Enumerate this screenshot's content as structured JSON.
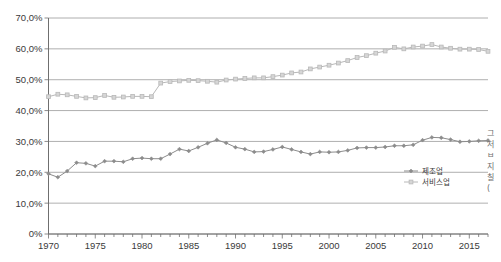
{
  "chart_data": {
    "type": "line",
    "title": "",
    "xlabel": "",
    "ylabel": "",
    "xlim": [
      1970,
      2017
    ],
    "ylim": [
      0,
      70
    ],
    "grid": true,
    "y_ticks": [
      0,
      10,
      20,
      30,
      40,
      50,
      60,
      70
    ],
    "y_tick_labels": [
      "0%",
      "10,0%",
      "20,0%",
      "30,0%",
      "40,0%",
      "50,0%",
      "60,0%",
      "70,0%"
    ],
    "x_ticks": [
      1970,
      1975,
      1980,
      1985,
      1990,
      1995,
      2000,
      2005,
      2010,
      2015
    ],
    "x_tick_labels": [
      "1970",
      "1975",
      "1980",
      "1985",
      "1990",
      "1995",
      "2000",
      "2005",
      "2010",
      "2015"
    ],
    "x_minor_tick_interval": 1,
    "legend_position": "inside-bottom-right",
    "x": [
      1970,
      1971,
      1972,
      1973,
      1974,
      1975,
      1976,
      1977,
      1978,
      1979,
      1980,
      1981,
      1982,
      1983,
      1984,
      1985,
      1986,
      1987,
      1988,
      1989,
      1990,
      1991,
      1992,
      1993,
      1994,
      1995,
      1996,
      1997,
      1998,
      1999,
      2000,
      2001,
      2002,
      2003,
      2004,
      2005,
      2006,
      2007,
      2008,
      2009,
      2010,
      2011,
      2012,
      2013,
      2014,
      2015,
      2016,
      2017
    ],
    "series": [
      {
        "name": "제조업",
        "color": "#8c8c8c",
        "marker": "diamond",
        "values": [
          19.5,
          18.4,
          20.4,
          23.1,
          22.9,
          22.0,
          23.6,
          23.6,
          23.4,
          24.4,
          24.6,
          24.4,
          24.4,
          25.9,
          27.5,
          26.9,
          28.1,
          29.4,
          30.5,
          29.5,
          28.1,
          27.5,
          26.6,
          26.7,
          27.4,
          28.2,
          27.4,
          26.6,
          25.9,
          26.6,
          26.5,
          26.6,
          27.1,
          27.9,
          28.0,
          28.0,
          28.2,
          28.6,
          28.6,
          28.9,
          30.4,
          31.3,
          31.2,
          30.6,
          29.9,
          30.0,
          30.2,
          30.3
        ]
      },
      {
        "name": "서비스업",
        "color": "#b8b8b8",
        "marker": "square",
        "values": [
          44.5,
          45.3,
          45.1,
          44.6,
          44.1,
          44.2,
          44.9,
          44.3,
          44.4,
          44.6,
          44.6,
          44.5,
          48.9,
          49.4,
          49.6,
          49.8,
          49.7,
          49.5,
          49.2,
          49.9,
          50.2,
          50.4,
          50.6,
          50.6,
          51.0,
          51.5,
          52.2,
          52.5,
          53.5,
          54.1,
          54.7,
          55.4,
          56.2,
          57.2,
          57.8,
          58.6,
          59.3,
          60.5,
          60.0,
          60.6,
          60.9,
          61.4,
          60.6,
          60.2,
          59.9,
          59.9,
          59.8,
          59.2
        ]
      }
    ]
  },
  "side_note": {
    "lines": [
      "그",
      "저",
      "ㅂ",
      "지",
      "칠",
      "("
    ]
  }
}
